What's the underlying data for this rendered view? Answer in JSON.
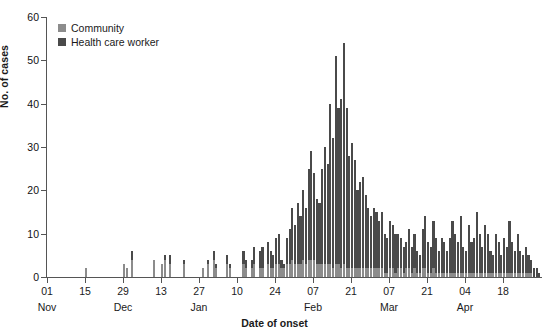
{
  "chart_data": {
    "type": "bar",
    "title": "",
    "subtitle": "",
    "xlabel": "Date of onset",
    "ylabel": "No. of cases",
    "ylim": [
      0,
      60
    ],
    "yticks": [
      0,
      10,
      20,
      30,
      40,
      50,
      60
    ],
    "grid": false,
    "stacked": true,
    "legend_position": "top-left",
    "legend": [
      "Community",
      "Health care worker"
    ],
    "colors": {
      "community": "#8c8c8c",
      "health_care_worker": "#4a4a4a",
      "axis": "#555555",
      "text": "#111111"
    },
    "x_tick_labels": [
      "01",
      "15",
      "29",
      "13",
      "27",
      "10",
      "24",
      "07",
      "21",
      "07",
      "21",
      "04",
      "18"
    ],
    "x_month_labels": [
      {
        "label": "Nov",
        "at_tick": 0
      },
      {
        "label": "Dec",
        "at_tick": 2
      },
      {
        "label": "Jan",
        "at_tick": 4
      },
      {
        "label": "Feb",
        "at_tick": 7
      },
      {
        "label": "Mar",
        "at_tick": 9
      },
      {
        "label": "Apr",
        "at_tick": 11
      }
    ],
    "x_tick_interval_days": 14,
    "x_start_date": "Nov 01",
    "n_bins": 182,
    "series": [
      {
        "name": "Community",
        "values": [
          0,
          0,
          0,
          0,
          0,
          0,
          0,
          0,
          0,
          0,
          0,
          0,
          0,
          0,
          2,
          0,
          0,
          0,
          0,
          0,
          0,
          0,
          0,
          0,
          0,
          0,
          0,
          0,
          3,
          2,
          0,
          4,
          0,
          0,
          0,
          0,
          0,
          0,
          0,
          4,
          0,
          0,
          3,
          4,
          0,
          3,
          0,
          0,
          0,
          0,
          3,
          0,
          0,
          0,
          0,
          0,
          0,
          2,
          0,
          3,
          0,
          4,
          2,
          0,
          0,
          0,
          3,
          2,
          0,
          0,
          0,
          0,
          3,
          2,
          0,
          2,
          3,
          0,
          2,
          2,
          0,
          3,
          2,
          2,
          3,
          3,
          2,
          2,
          3,
          3,
          4,
          3,
          3,
          3,
          4,
          3,
          4,
          4,
          4,
          3,
          3,
          3,
          3,
          3,
          3,
          2,
          3,
          3,
          2,
          3,
          2,
          2,
          2,
          2,
          2,
          2,
          2,
          2,
          2,
          2,
          2,
          2,
          2,
          2,
          1,
          1,
          2,
          2,
          1,
          2,
          2,
          1,
          2,
          2,
          1,
          2,
          1,
          1,
          2,
          2,
          1,
          1,
          2,
          1,
          1,
          1,
          1,
          1,
          1,
          1,
          1,
          1,
          1,
          1,
          1,
          1,
          1,
          1,
          1,
          1,
          1,
          1,
          1,
          1,
          1,
          1,
          1,
          1,
          1,
          1,
          1,
          1,
          1,
          1,
          1,
          1,
          1,
          1,
          1,
          0,
          0,
          0
        ]
      },
      {
        "name": "Health care worker",
        "values": [
          0,
          0,
          0,
          0,
          0,
          0,
          0,
          0,
          0,
          0,
          0,
          0,
          0,
          0,
          0,
          0,
          0,
          0,
          0,
          0,
          0,
          0,
          0,
          0,
          0,
          0,
          0,
          0,
          0,
          0,
          0,
          2,
          0,
          0,
          0,
          0,
          0,
          0,
          0,
          0,
          0,
          0,
          0,
          1,
          0,
          2,
          0,
          0,
          0,
          0,
          1,
          0,
          0,
          0,
          0,
          0,
          0,
          0,
          0,
          1,
          0,
          2,
          1,
          0,
          0,
          0,
          2,
          1,
          0,
          0,
          0,
          0,
          3,
          2,
          0,
          2,
          4,
          0,
          4,
          5,
          0,
          5,
          4,
          3,
          6,
          7,
          2,
          1,
          6,
          8,
          12,
          9,
          14,
          11,
          16,
          13,
          21,
          25,
          20,
          15,
          14,
          22,
          27,
          23,
          37,
          30,
          48,
          36,
          39,
          51,
          37,
          26,
          29,
          25,
          18,
          20,
          21,
          17,
          14,
          12,
          14,
          13,
          11,
          13,
          9,
          8,
          11,
          10,
          9,
          8,
          7,
          6,
          6,
          9,
          6,
          8,
          5,
          4,
          9,
          12,
          7,
          6,
          11,
          8,
          5,
          8,
          7,
          5,
          8,
          12,
          9,
          7,
          13,
          6,
          5,
          11,
          7,
          8,
          14,
          9,
          6,
          11,
          9,
          5,
          4,
          9,
          7,
          4,
          8,
          6,
          12,
          7,
          5,
          9,
          5,
          4,
          6,
          4,
          3,
          2,
          2,
          1
        ]
      }
    ],
    "peak": {
      "value": 54,
      "approx_date": "Feb 05"
    }
  },
  "legend": {
    "items": [
      {
        "label": "Community",
        "swatch": "legend-swatch-community"
      },
      {
        "label": "Health care worker",
        "swatch": "legend-swatch-hcw"
      }
    ]
  },
  "axes": {
    "y_title": "No. of cases",
    "x_title": "Date of onset"
  }
}
